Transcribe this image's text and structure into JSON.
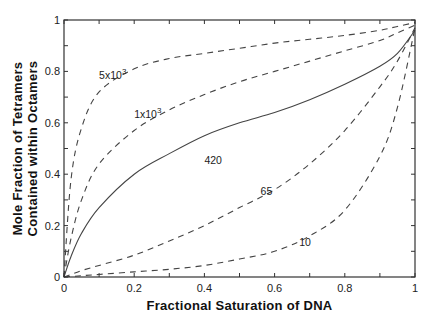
{
  "chart_data": {
    "type": "line",
    "title": "",
    "xlabel": "Fractional Saturation of DNA",
    "ylabel_lines": [
      "Mole Fraction of Tetramers",
      "Contained within Octamers"
    ],
    "xlim": [
      0,
      1
    ],
    "ylim": [
      0,
      1
    ],
    "grid": false,
    "legend": "inline curve labels",
    "x_ticks": [
      0,
      0.2,
      0.4,
      0.6,
      0.8,
      1
    ],
    "x_tick_labels": [
      "0",
      "0.2",
      "0.4",
      "0.6",
      "0.8",
      "1"
    ],
    "y_ticks": [
      0,
      0.2,
      0.4,
      0.6,
      0.8,
      1
    ],
    "y_tick_labels": [
      "0",
      "0.2",
      "0.4",
      "0.6",
      "0.8",
      "1"
    ],
    "x": [
      0,
      0.02,
      0.05,
      0.1,
      0.2,
      0.3,
      0.4,
      0.5,
      0.6,
      0.7,
      0.8,
      0.9,
      0.95,
      1.0
    ],
    "series": [
      {
        "name": "5x10^3",
        "label": "5x10",
        "label_sup": "3",
        "style": "dashed",
        "values": [
          0,
          0.38,
          0.58,
          0.72,
          0.81,
          0.85,
          0.87,
          0.89,
          0.91,
          0.925,
          0.94,
          0.96,
          0.975,
          0.99
        ]
      },
      {
        "name": "1x10^3",
        "label": "1x10",
        "label_sup": "3",
        "style": "dashed",
        "values": [
          0,
          0.15,
          0.3,
          0.44,
          0.57,
          0.65,
          0.71,
          0.76,
          0.8,
          0.84,
          0.88,
          0.92,
          0.95,
          0.98
        ]
      },
      {
        "name": "420",
        "label": "420",
        "label_sup": "",
        "style": "solid",
        "values": [
          0,
          0.08,
          0.17,
          0.27,
          0.4,
          0.48,
          0.55,
          0.6,
          0.64,
          0.69,
          0.75,
          0.82,
          0.87,
          0.96
        ]
      },
      {
        "name": "65",
        "label": "65",
        "label_sup": "",
        "style": "dashed",
        "values": [
          0,
          0.01,
          0.025,
          0.045,
          0.085,
          0.14,
          0.2,
          0.27,
          0.34,
          0.44,
          0.57,
          0.74,
          0.84,
          0.97
        ]
      },
      {
        "name": "10",
        "label": "10",
        "label_sup": "",
        "style": "dashed",
        "values": [
          0,
          0.002,
          0.005,
          0.01,
          0.02,
          0.03,
          0.045,
          0.07,
          0.1,
          0.16,
          0.26,
          0.47,
          0.66,
          0.97
        ]
      }
    ],
    "curve_label_positions": [
      {
        "series": "5x10^3",
        "x": 0.1,
        "y": 0.77
      },
      {
        "series": "1x10^3",
        "x": 0.2,
        "y": 0.62
      },
      {
        "series": "420",
        "x": 0.4,
        "y": 0.44
      },
      {
        "series": "65",
        "x": 0.56,
        "y": 0.32
      },
      {
        "series": "10",
        "x": 0.67,
        "y": 0.12
      }
    ]
  }
}
